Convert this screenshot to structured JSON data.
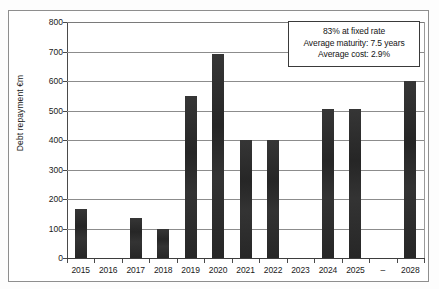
{
  "chart_data": {
    "type": "bar",
    "title": "",
    "xlabel": "",
    "ylabel": "Debt repayment €m",
    "ylim": [
      0,
      800
    ],
    "ytick_step": 100,
    "grid": true,
    "legend": "none",
    "bar_color": "#2b2b2b",
    "categories": [
      "2015",
      "2016",
      "2017",
      "2018",
      "2019",
      "2020",
      "2021",
      "2022",
      "2023",
      "2024",
      "2025",
      "–",
      "2028"
    ],
    "values": [
      165,
      0,
      135,
      100,
      550,
      690,
      400,
      400,
      0,
      505,
      505,
      0,
      600
    ],
    "ytick_labels": [
      "800",
      "700",
      "600",
      "500",
      "400",
      "300",
      "200",
      "100",
      "0"
    ],
    "ytick_values": [
      800,
      700,
      600,
      500,
      400,
      300,
      200,
      100,
      0
    ],
    "annotations": [
      "83% at fixed rate",
      "Average maturity: 7.5 years",
      "Average cost: 2.9%"
    ]
  }
}
